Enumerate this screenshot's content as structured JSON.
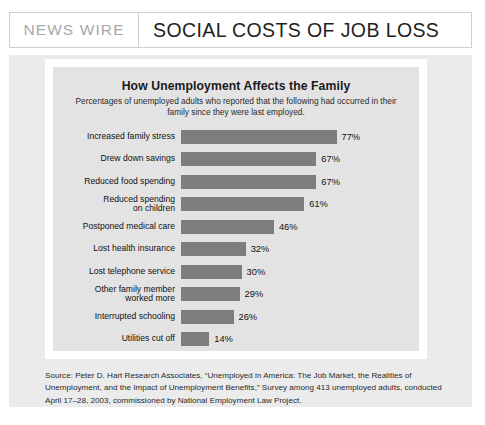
{
  "header": {
    "kicker": "NEWS WIRE",
    "title": "SOCIAL COSTS OF JOB LOSS"
  },
  "chart_data": {
    "type": "bar",
    "orientation": "horizontal",
    "title": "How Unemployment Affects the Family",
    "subtitle": "Percentages of unemployed adults who reported that the following had occurred in their family since they were last employed.",
    "xlabel": "",
    "ylabel": "",
    "xlim": [
      0,
      100
    ],
    "grid": false,
    "legend": false,
    "value_suffix": "%",
    "bar_color": "#7d7d7d",
    "background_color": "#e3e3e3",
    "categories": [
      "Increased family stress",
      "Drew down savings",
      "Reduced food spending",
      "Reduced spending\non children",
      "Postponed medical care",
      "Lost health insurance",
      "Lost telephone service",
      "Other family member\nworked more",
      "Interrupted schooling",
      "Utilities cut off"
    ],
    "values": [
      77,
      67,
      67,
      61,
      46,
      32,
      30,
      29,
      26,
      14
    ],
    "value_labels": [
      "77%",
      "67%",
      "67%",
      "61%",
      "46%",
      "32%",
      "30%",
      "29%",
      "26%",
      "14%"
    ]
  },
  "source": {
    "text": "Source: Peter D. Hart Research Associates, “Unemployed in America: The Job Market, the Realities of Unemployment, and the Impact of Unemployment Benefits,” Survey among 413 unemployed adults, conducted April 17–28, 2003, commissioned by National Employment Law Project."
  }
}
